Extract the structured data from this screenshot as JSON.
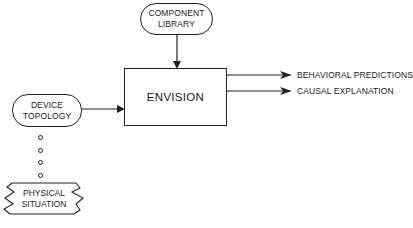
{
  "diagram": {
    "nodes": {
      "component_library": {
        "line1": "COMPONENT",
        "line2": "LIBRARY"
      },
      "envision": {
        "label": "ENVISION"
      },
      "device_topology": {
        "line1": "DEVICE",
        "line2": "TOPOLOGY"
      },
      "physical_situation": {
        "line1": "PHYSICAL",
        "line2": "SITUATION"
      }
    },
    "outputs": [
      {
        "label": "BEHAVIORAL PREDICTIONS"
      },
      {
        "label": "CAUSAL EXPLANATION"
      }
    ],
    "edges": [
      {
        "from": "COMPONENT LIBRARY",
        "to": "ENVISION",
        "style": "arrow"
      },
      {
        "from": "DEVICE TOPOLOGY",
        "to": "ENVISION",
        "style": "arrow"
      },
      {
        "from": "ENVISION",
        "to": "BEHAVIORAL PREDICTIONS",
        "style": "arrow"
      },
      {
        "from": "ENVISION",
        "to": "CAUSAL EXPLANATION",
        "style": "arrow"
      },
      {
        "from": "PHYSICAL SITUATION",
        "to": "DEVICE TOPOLOGY",
        "style": "dotted-circles"
      }
    ],
    "colors": {
      "ink": "#222222",
      "background": "#ffffff"
    }
  }
}
